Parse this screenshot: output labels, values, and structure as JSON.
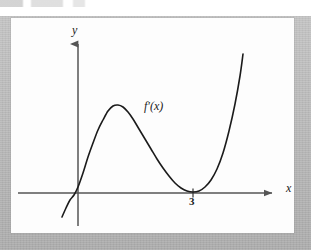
{
  "figure": {
    "panel_background": "#fdfdfd",
    "frame_color": "#b4b4b4",
    "ink_color": "#1b1b1b",
    "axis_color": "#555555"
  },
  "labels": {
    "y_axis": "y",
    "x_axis": "x",
    "curve": "f′(x)",
    "x_tick_3": "3"
  },
  "chart_data": {
    "type": "line",
    "title": "",
    "subtitle": "",
    "xlabel": "x",
    "ylabel": "y",
    "legend": [
      "f′(x)"
    ],
    "legend_position": "inline-annotation",
    "grid": false,
    "axes": {
      "x_axis_drawn": true,
      "y_axis_drawn": true,
      "x_arrow": true,
      "y_arrow": true,
      "x_ticks": [
        3
      ],
      "x_tick_labels": [
        "3"
      ],
      "y_ticks": [],
      "y_tick_labels": []
    },
    "annotations": [
      {
        "text": "f′(x)",
        "x_px": 148,
        "y_px": 107,
        "style": "italic-serif"
      },
      {
        "text": "3",
        "x_px": 193,
        "y_px": 201,
        "style": "tick-label"
      },
      {
        "text": "y",
        "x_px": 76,
        "y_px": 30,
        "style": "italic-serif"
      },
      {
        "text": "x",
        "x_px": 290,
        "y_px": 188,
        "style": "italic-serif"
      }
    ],
    "series": [
      {
        "name": "f′(x)",
        "description": "Cubic-like curve: rises steeply from lower left, crosses the x-axis just left of the y-axis, reaches a local maximum, falls to touch the x-axis tangentially at x = 3 (a double root / local minimum on the axis), then rises steeply.",
        "roots": [
          0,
          3,
          3
        ],
        "local_maximum": {
          "x_px": 112,
          "y_px": 105
        },
        "local_minimum": {
          "x_px": 193,
          "y_px": 192
        },
        "path_points_px": [
          [
            62,
            217
          ],
          [
            66,
            208
          ],
          [
            70,
            200
          ],
          [
            74,
            195
          ],
          [
            78,
            187
          ],
          [
            83,
            173
          ],
          [
            88,
            157
          ],
          [
            93,
            143
          ],
          [
            98,
            130
          ],
          [
            103,
            120
          ],
          [
            108,
            111
          ],
          [
            113,
            106
          ],
          [
            118,
            105
          ],
          [
            123,
            107
          ],
          [
            128,
            112
          ],
          [
            133,
            119
          ],
          [
            139,
            129
          ],
          [
            145,
            139
          ],
          [
            151,
            149
          ],
          [
            157,
            159
          ],
          [
            163,
            168
          ],
          [
            169,
            176
          ],
          [
            175,
            183
          ],
          [
            181,
            188
          ],
          [
            187,
            191
          ],
          [
            193,
            192
          ],
          [
            199,
            191
          ],
          [
            205,
            187
          ],
          [
            211,
            180
          ],
          [
            217,
            169
          ],
          [
            223,
            153
          ],
          [
            229,
            131
          ],
          [
            235,
            104
          ],
          [
            240,
            76
          ],
          [
            243,
            54
          ]
        ],
        "x_axis_crossings_px": [
          76,
          193
        ],
        "stroke_width": 1.6
      }
    ],
    "axis_extent_px": {
      "x_axis_y": 193,
      "x_axis_x_start": 18,
      "x_axis_x_end": 278,
      "y_axis_x": 78,
      "y_axis_y_top": 38,
      "y_axis_y_bottom": 226
    }
  }
}
